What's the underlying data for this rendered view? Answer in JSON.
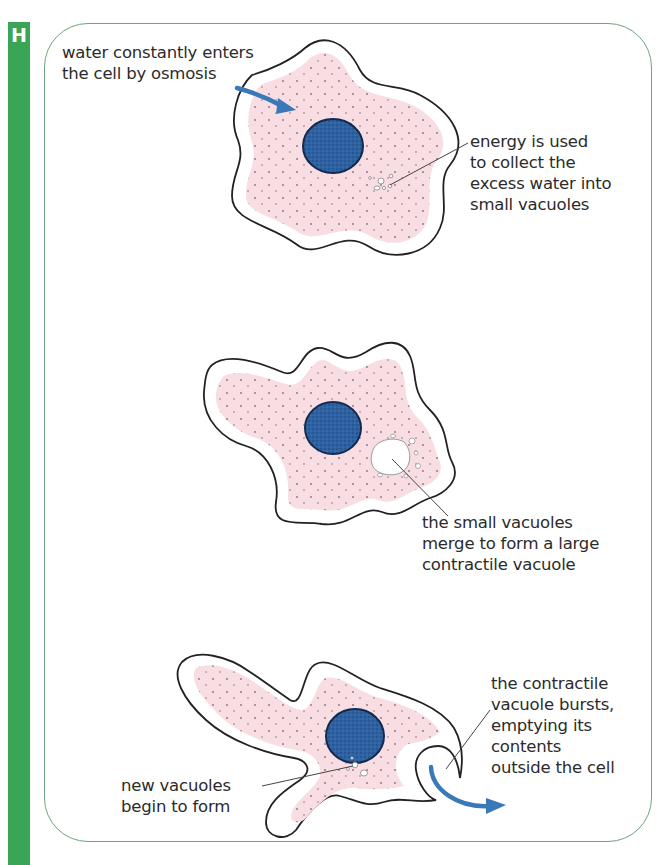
{
  "panel": {
    "marker_letter": "H",
    "accent_color": "#3aa655",
    "frame_color": "#6fa37c",
    "cytoplasm_color": "#f8dde3",
    "nucleus_color": "#2e5f9e",
    "arrow_color": "#3b78b8"
  },
  "stages": [
    {
      "label_lines": [
        "water constantly enters",
        "the cell by osmosis"
      ],
      "annotation_lines": [
        "energy is used",
        "to collect the",
        "excess water into",
        "small vacuoles"
      ]
    },
    {
      "annotation_lines": [
        "the small vacuoles",
        "merge to form a large",
        "contractile vacuole"
      ]
    },
    {
      "annotation_lines": [
        "the contractile",
        "vacuole bursts,",
        "emptying its",
        "contents",
        "outside the cell"
      ],
      "left_annotation_lines": [
        "new vacuoles",
        "begin to form"
      ]
    }
  ],
  "icons": {
    "inflow_arrow": "arrow-curved-right",
    "outflow_arrow": "arrow-curved-right"
  }
}
